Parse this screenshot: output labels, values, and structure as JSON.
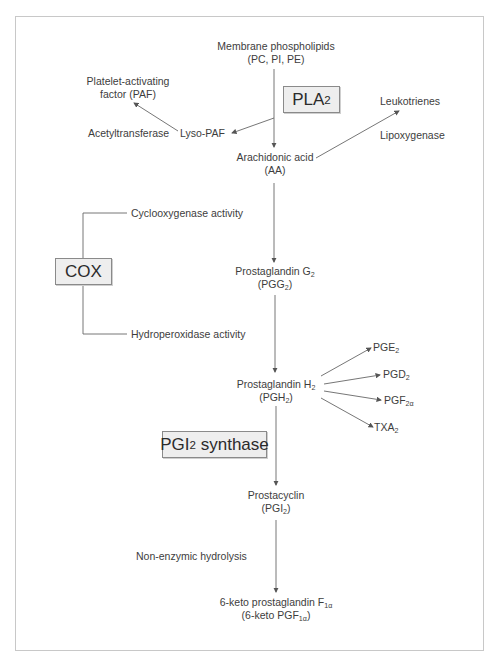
{
  "diagram": {
    "type": "pathway-flowchart",
    "nodes": {
      "membrane": {
        "line1": "Membrane phospholipids",
        "line2": "(PC, PI, PE)"
      },
      "paf": {
        "line1": "Platelet-activating",
        "line2": "factor (PAF)"
      },
      "acetyltransferase": {
        "label": "Acetyltransferase"
      },
      "lyso_paf": {
        "label": "Lyso-PAF"
      },
      "leukotrienes": {
        "label": "Leukotrienes"
      },
      "lipoxygenase": {
        "label": "Lipoxygenase"
      },
      "aa": {
        "line1": "Arachidonic acid",
        "line2": "(AA)"
      },
      "cox_activity": {
        "label": "Cyclooxygenase activity"
      },
      "hydroperoxidase": {
        "label": "Hydroperoxidase activity"
      },
      "pgg2": {
        "line1_base": "Prostaglandin G",
        "line1_sub": "2",
        "line2_base": "(PGG",
        "line2_sub": "2",
        "line2_end": ")"
      },
      "pgh2": {
        "line1_base": "Prostaglandin H",
        "line1_sub": "2",
        "line2_base": "(PGH",
        "line2_sub": "2",
        "line2_end": ")"
      },
      "pge2": {
        "base": "PGE",
        "sub": "2"
      },
      "pgd2": {
        "base": "PGD",
        "sub": "2"
      },
      "pgf2a": {
        "base": "PGF",
        "sub": "2α"
      },
      "txa2": {
        "base": "TXA",
        "sub": "2"
      },
      "pgi2": {
        "line1": "Prostacyclin",
        "line2_base": "(PGI",
        "line2_sub": "2",
        "line2_end": ")"
      },
      "hydrolysis": {
        "label": "Non-enzymic hydrolysis"
      },
      "keto": {
        "line1_base": "6-keto prostaglandin F",
        "line1_sub": "1α",
        "line2_base": "(6-keto PGF",
        "line2_sub": "1α",
        "line2_end": ")"
      }
    },
    "enzyme_boxes": {
      "pla2": {
        "base": "PLA",
        "sub": "2"
      },
      "cox": {
        "label": "COX"
      },
      "pgi2_synthase": {
        "base": "PGI",
        "sub": "2",
        "rest": " synthase"
      }
    },
    "colors": {
      "box_fill": "#eeeeee",
      "box_border": "#8a8a8a",
      "line": "#666666",
      "frame": "#c8c8c8",
      "text": "#3d3d3d"
    }
  }
}
